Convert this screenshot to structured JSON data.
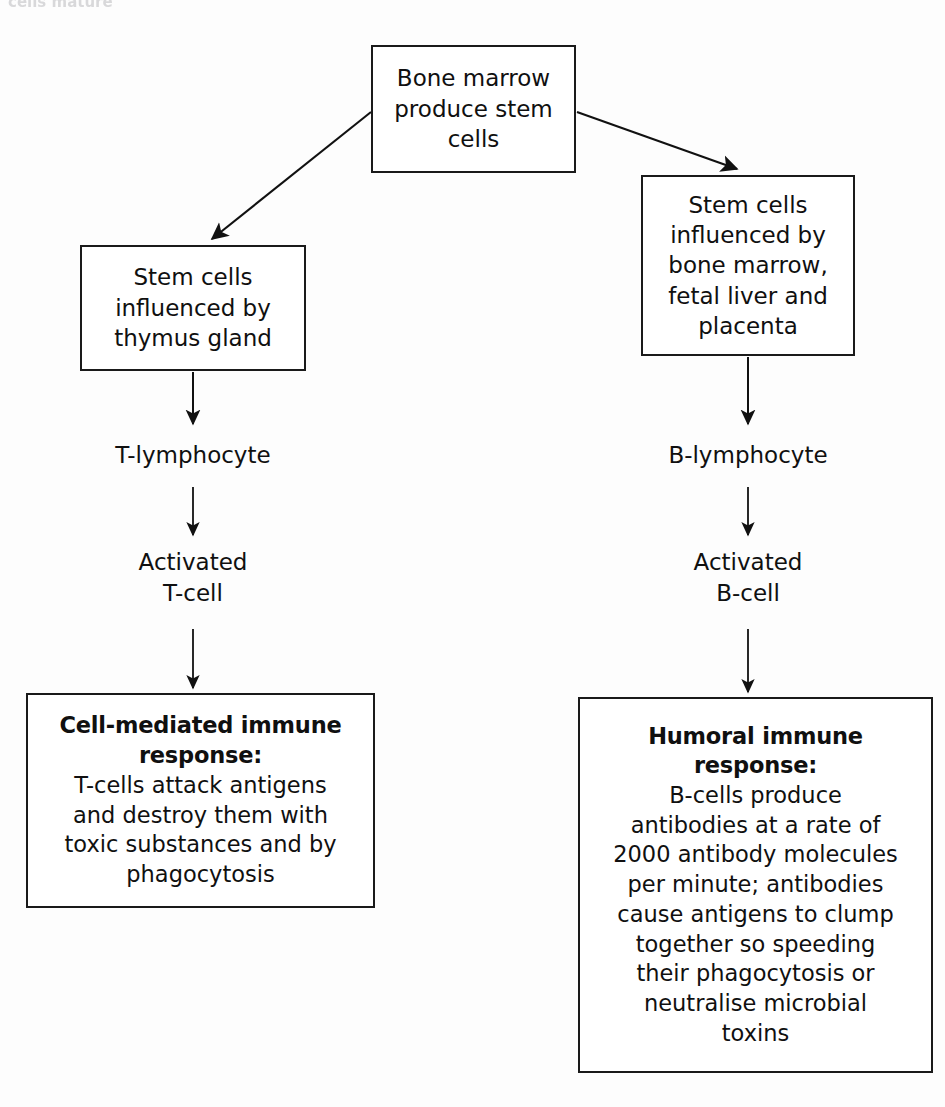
{
  "diagram": {
    "title_fragment": "cells mature",
    "nodes": {
      "bone_marrow": "Bone marrow\nproduce stem\ncells",
      "thymus": "Stem cells\ninfluenced by\nthymus gland",
      "marrow_liver_placenta": "Stem cells\ninfluenced by\nbone marrow,\nfetal liver and\nplacenta",
      "t_lymphocyte": "T-lymphocyte",
      "b_lymphocyte": "B-lymphocyte",
      "activated_t_cell": "Activated\nT-cell",
      "activated_b_cell": "Activated\nB-cell",
      "cell_mediated_heading": "Cell-mediated immune\nresponse:",
      "cell_mediated_body": "T-cells attack antigens\nand destroy them with\ntoxic substances and by\nphagocytosis",
      "humoral_heading": "Humoral immune\nresponse:",
      "humoral_body": "B-cells produce\nantibodies at a rate of\n2000 antibody molecules\nper minute; antibodies\ncause antigens to clump\ntogether so speeding\ntheir phagocytosis or\nneutralise microbial\ntoxins"
    },
    "edges": [
      {
        "name": "bone-marrow-to-thymus",
        "type": "diagonal-arrow"
      },
      {
        "name": "bone-marrow-to-marrow-liver-placenta",
        "type": "diagonal-arrow"
      },
      {
        "name": "thymus-to-t-lymphocyte",
        "type": "vertical-arrow"
      },
      {
        "name": "t-lymphocyte-to-activated-t-cell",
        "type": "vertical-arrow"
      },
      {
        "name": "activated-t-cell-to-cell-mediated",
        "type": "vertical-arrow"
      },
      {
        "name": "marrow-liver-placenta-to-b-lymphocyte",
        "type": "vertical-arrow"
      },
      {
        "name": "b-lymphocyte-to-activated-b-cell",
        "type": "vertical-arrow"
      },
      {
        "name": "activated-b-cell-to-humoral",
        "type": "vertical-arrow"
      }
    ],
    "colors": {
      "line": "#1a1a1a",
      "text": "#101010",
      "background": "#fdfdfd"
    }
  }
}
